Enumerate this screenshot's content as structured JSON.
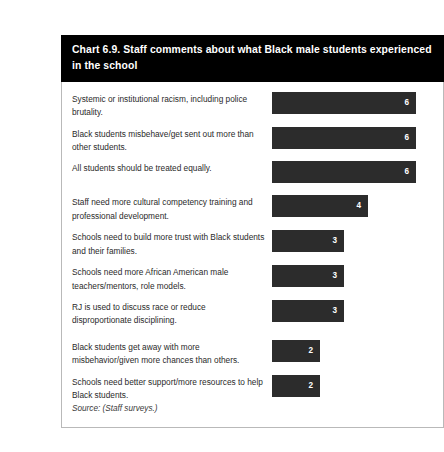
{
  "title": "Chart 6.9. Staff comments about what Black male students experienced in the school",
  "source_note": "Source: (Staff surveys.)",
  "colors": {
    "title_background": "#000000",
    "title_text": "#ffffff",
    "bar_fill": "#2c2c2c",
    "bar_value_text": "#ffffff",
    "body_border": "#b9b9b9",
    "label_text": "#2a2a2a",
    "page_background": "#ffffff"
  },
  "chart_data": {
    "type": "bar",
    "orientation": "horizontal",
    "title": "Chart 6.9. Staff comments about what Black male students experienced in the school",
    "xlabel": "",
    "ylabel": "",
    "xlim": [
      0,
      6
    ],
    "grid": false,
    "legend": "none",
    "value_labels": true,
    "value_label_position": "inside-end",
    "units_per_pixel": 24,
    "categories": [
      "Systemic or institutional racism, including police brutality.",
      "Black students misbehave/get sent out more than other students.",
      "All students should be treated equally.",
      "Staff need more cultural competency training and professional development.",
      "Schools need to build more trust with Black students and their families.",
      "Schools need more African American male teachers/mentors, role models.",
      "RJ is used to discuss race or reduce disproportionate disciplining.",
      "Black students get away with more misbehavior/given more chances than others.",
      "Schools need better support/more resources to help Black students."
    ],
    "values": [
      6,
      6,
      6,
      4,
      3,
      3,
      3,
      2,
      2
    ],
    "groups": [
      {
        "start_index": 0,
        "count": 3
      },
      {
        "start_index": 3,
        "count": 4
      },
      {
        "start_index": 7,
        "count": 2
      }
    ]
  },
  "rows": [
    {
      "label": "Systemic or institutional racism, including police brutality.",
      "value": "6",
      "bar_width_px": 144,
      "group_break": false
    },
    {
      "label": "Black students misbehave/get sent out more than other students.",
      "value": "6",
      "bar_width_px": 144,
      "group_break": false
    },
    {
      "label": "All students should be treated equally.",
      "value": "6",
      "bar_width_px": 144,
      "group_break": false
    },
    {
      "label": "Staff need more cultural competency training and professional development.",
      "value": "4",
      "bar_width_px": 96,
      "group_break": true
    },
    {
      "label": "Schools need to build more trust with Black students and their families.",
      "value": "3",
      "bar_width_px": 72,
      "group_break": false
    },
    {
      "label": "Schools need more African American male teachers/mentors, role models.",
      "value": "3",
      "bar_width_px": 72,
      "group_break": false
    },
    {
      "label": "RJ is used to discuss race or reduce disproportionate disciplining.",
      "value": "3",
      "bar_width_px": 72,
      "group_break": false
    },
    {
      "label": "Black students get away with more misbehavior/given more chances than others.",
      "value": "2",
      "bar_width_px": 48,
      "group_break": true
    },
    {
      "label": "Schools need better support/more resources to help Black students.",
      "value": "2",
      "bar_width_px": 48,
      "group_break": false
    }
  ]
}
